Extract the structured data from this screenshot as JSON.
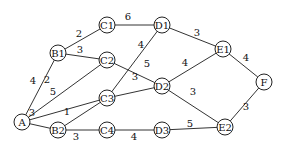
{
  "graph": {
    "nodes": [
      {
        "id": "A",
        "x": 22,
        "y": 122
      },
      {
        "id": "B1",
        "x": 58,
        "y": 53
      },
      {
        "id": "B2",
        "x": 58,
        "y": 130
      },
      {
        "id": "C1",
        "x": 107,
        "y": 25
      },
      {
        "id": "C2",
        "x": 107,
        "y": 60
      },
      {
        "id": "C3",
        "x": 107,
        "y": 98
      },
      {
        "id": "C4",
        "x": 107,
        "y": 130
      },
      {
        "id": "D1",
        "x": 162,
        "y": 25
      },
      {
        "id": "D2",
        "x": 162,
        "y": 86
      },
      {
        "id": "D3",
        "x": 162,
        "y": 130
      },
      {
        "id": "E1",
        "x": 223,
        "y": 49
      },
      {
        "id": "E2",
        "x": 225,
        "y": 127
      },
      {
        "id": "F",
        "x": 264,
        "y": 82
      }
    ],
    "edges": [
      {
        "from": "A",
        "to": "B1",
        "weight": "4",
        "lx": 33,
        "ly": 80
      },
      {
        "from": "A",
        "to": "C2",
        "weight": "2",
        "lx": 47,
        "ly": 79
      },
      {
        "from": "A",
        "to": "C3",
        "weight": "5",
        "lx": 53,
        "ly": 91
      },
      {
        "from": "A",
        "to": "B2",
        "weight": "3",
        "lx": 32,
        "ly": 112
      },
      {
        "from": "B1",
        "to": "C1",
        "weight": "2",
        "lx": 79,
        "ly": 33
      },
      {
        "from": "B1",
        "to": "C2",
        "weight": "3",
        "lx": 80,
        "ly": 49
      },
      {
        "from": "C1",
        "to": "D1",
        "weight": "6",
        "lx": 128,
        "ly": 16
      },
      {
        "from": "C2",
        "to": "D2",
        "weight": "5",
        "lx": 147,
        "ly": 63
      },
      {
        "from": "C3",
        "to": "D1",
        "weight": "4",
        "lx": 141,
        "ly": 44
      },
      {
        "from": "C3",
        "to": "D2",
        "weight": "3",
        "lx": 135,
        "ly": 76
      },
      {
        "from": "B2",
        "to": "C3",
        "weight": "1",
        "lx": 67,
        "ly": 111
      },
      {
        "from": "B2",
        "to": "C4",
        "weight": "3",
        "lx": 76,
        "ly": 136
      },
      {
        "from": "C4",
        "to": "D3",
        "weight": "4",
        "lx": 134,
        "ly": 136
      },
      {
        "from": "D1",
        "to": "E1",
        "weight": "3",
        "lx": 197,
        "ly": 32
      },
      {
        "from": "D2",
        "to": "E1",
        "weight": "4",
        "lx": 185,
        "ly": 62
      },
      {
        "from": "D2",
        "to": "E2",
        "weight": "3",
        "lx": 193,
        "ly": 91
      },
      {
        "from": "D3",
        "to": "E2",
        "weight": "5",
        "lx": 190,
        "ly": 123
      },
      {
        "from": "E1",
        "to": "F",
        "weight": "4",
        "lx": 246,
        "ly": 57
      },
      {
        "from": "E2",
        "to": "F",
        "weight": "3",
        "lx": 246,
        "ly": 106
      }
    ]
  }
}
